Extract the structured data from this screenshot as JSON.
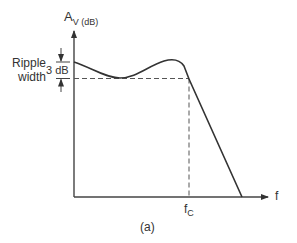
{
  "diagram": {
    "type": "filter-response",
    "y_axis_label": "A",
    "y_axis_sub": "V (dB)",
    "x_axis_label": "f",
    "cutoff_label": "f",
    "cutoff_sub": "C",
    "ripple_label_line1": "Ripple",
    "ripple_label_line2": "width",
    "ripple_value": "3 dB",
    "caption": "(a)",
    "colors": {
      "line": "#333333",
      "dashed": "#555555",
      "background": "#ffffff"
    }
  }
}
